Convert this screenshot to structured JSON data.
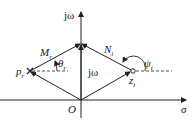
{
  "diagram": {
    "type": "s-plane vector diagram",
    "axes": {
      "vertical_label": "jω",
      "horizontal_label": "σ",
      "origin_label": "O"
    },
    "points": {
      "pole_label": "p",
      "pole_sub": "r",
      "zero_label": "z",
      "zero_sub": "i"
    },
    "vectors": {
      "pole_vector_label": "M",
      "pole_vector_sub": "r",
      "zero_vector_label": "N",
      "zero_vector_sub": "i",
      "origin_vector_label": "jω"
    },
    "angles": {
      "pole_angle": "θ",
      "pole_angle_sub": "r",
      "zero_angle": "ψ",
      "zero_angle_sub": "i"
    },
    "colors": {
      "line": "#222222",
      "background": "#ffffff"
    }
  }
}
